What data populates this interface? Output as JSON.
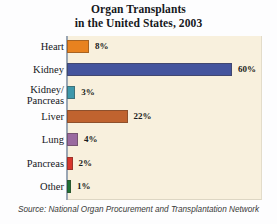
{
  "title": {
    "line1": "Organ Transplants",
    "line2": "in the United States, 2003"
  },
  "source": {
    "text": "Source: National Organ Procurement and Transplantation Network"
  },
  "chart_data": {
    "type": "bar",
    "orientation": "horizontal",
    "title": "Organ Transplants in the United States, 2003",
    "xlabel": "",
    "ylabel": "",
    "xlim": [
      0,
      70
    ],
    "grid": false,
    "legend": "none",
    "value_suffix": "%",
    "plot_background": "#f8f0dd",
    "categories": [
      "Heart",
      "Kidney",
      "Kidney/\nPancreas",
      "Liver",
      "Lung",
      "Pancreas",
      "Other"
    ],
    "values": [
      8,
      60,
      3,
      22,
      4,
      2,
      1
    ],
    "value_labels": [
      "8%",
      "60%",
      "3%",
      "22%",
      "4%",
      "2%",
      "1%"
    ],
    "colors": [
      "#e8821f",
      "#44549d",
      "#3e98ab",
      "#c0632f",
      "#9a6aa0",
      "#d8352c",
      "#1d7236"
    ],
    "bars": [
      {
        "label_lines": [
          "Heart"
        ],
        "value": 8,
        "value_label": "8%",
        "color": "#e8821f"
      },
      {
        "label_lines": [
          "Kidney"
        ],
        "value": 60,
        "value_label": "60%",
        "color": "#44549d"
      },
      {
        "label_lines": [
          "Kidney/",
          "Pancreas"
        ],
        "value": 3,
        "value_label": "3%",
        "color": "#3e98ab"
      },
      {
        "label_lines": [
          "Liver"
        ],
        "value": 22,
        "value_label": "22%",
        "color": "#c0632f"
      },
      {
        "label_lines": [
          "Lung"
        ],
        "value": 4,
        "value_label": "4%",
        "color": "#9a6aa0"
      },
      {
        "label_lines": [
          "Pancreas"
        ],
        "value": 2,
        "value_label": "2%",
        "color": "#d8352c"
      },
      {
        "label_lines": [
          "Other"
        ],
        "value": 1,
        "value_label": "1%",
        "color": "#1d7236"
      }
    ]
  }
}
